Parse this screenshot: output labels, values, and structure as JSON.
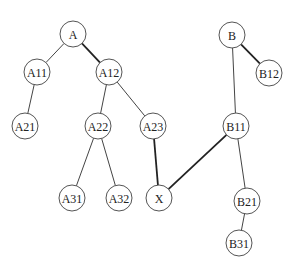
{
  "diagram": {
    "type": "tree-graph",
    "node_radius": 13,
    "nodes": [
      {
        "id": "A",
        "label": "A",
        "x": 73,
        "y": 34
      },
      {
        "id": "A11",
        "label": "A11",
        "x": 37,
        "y": 72
      },
      {
        "id": "A12",
        "label": "A12",
        "x": 109,
        "y": 72
      },
      {
        "id": "A21",
        "label": "A21",
        "x": 25,
        "y": 126
      },
      {
        "id": "A22",
        "label": "A22",
        "x": 98,
        "y": 126
      },
      {
        "id": "A23",
        "label": "A23",
        "x": 153,
        "y": 126
      },
      {
        "id": "A31",
        "label": "A31",
        "x": 72,
        "y": 198
      },
      {
        "id": "A32",
        "label": "A32",
        "x": 119,
        "y": 198
      },
      {
        "id": "X",
        "label": "X",
        "x": 159,
        "y": 198
      },
      {
        "id": "B",
        "label": "B",
        "x": 232,
        "y": 35
      },
      {
        "id": "B12",
        "label": "B12",
        "x": 269,
        "y": 73
      },
      {
        "id": "B11",
        "label": "B11",
        "x": 236,
        "y": 126
      },
      {
        "id": "B21",
        "label": "B21",
        "x": 247,
        "y": 201
      },
      {
        "id": "B31",
        "label": "B31",
        "x": 239,
        "y": 243
      }
    ],
    "edges": [
      {
        "from": "A",
        "to": "A11",
        "bold": false
      },
      {
        "from": "A",
        "to": "A12",
        "bold": true
      },
      {
        "from": "A11",
        "to": "A21",
        "bold": false
      },
      {
        "from": "A12",
        "to": "A22",
        "bold": false
      },
      {
        "from": "A12",
        "to": "A23",
        "bold": false
      },
      {
        "from": "A22",
        "to": "A31",
        "bold": false
      },
      {
        "from": "A22",
        "to": "A32",
        "bold": false
      },
      {
        "from": "A23",
        "to": "X",
        "bold": true
      },
      {
        "from": "B11",
        "to": "X",
        "bold": true
      },
      {
        "from": "B",
        "to": "B12",
        "bold": true
      },
      {
        "from": "B",
        "to": "B11",
        "bold": false
      },
      {
        "from": "B11",
        "to": "B21",
        "bold": false
      },
      {
        "from": "B21",
        "to": "B31",
        "bold": false
      }
    ]
  }
}
